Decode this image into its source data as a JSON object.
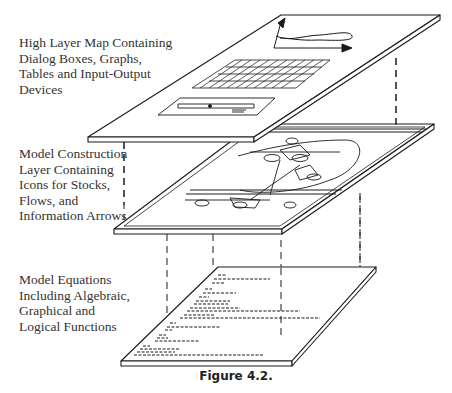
{
  "figure": {
    "caption": "Figure 4.2.",
    "layers": [
      {
        "name": "high-layer-map",
        "label_lines": [
          "High Layer Map Containing",
          "Dialog Boxes, Graphs,",
          "Tables and Input-Output",
          "Devices"
        ]
      },
      {
        "name": "model-construction-layer",
        "label_lines": [
          "Model Construction",
          "Layer Containing",
          "Icons for Stocks,",
          "Flows, and",
          "Information Arrows"
        ]
      },
      {
        "name": "model-equations-layer",
        "label_lines": [
          "Model Equations",
          "Including Algebraic,",
          "Graphical and",
          "Logical Functions"
        ]
      }
    ]
  },
  "colors": {
    "line": "#1a1a1a",
    "text": "#333333",
    "background": "#ffffff"
  }
}
